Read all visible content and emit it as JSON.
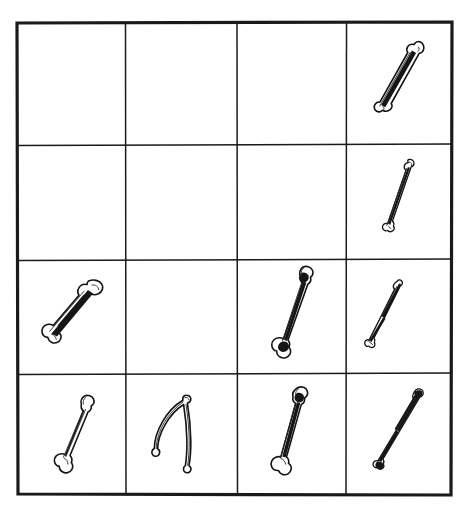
{
  "figure": {
    "background_color": "#ffffff",
    "ink_color": "#141414",
    "grid": {
      "rows": 4,
      "columns": 4,
      "border_color": "#1a1a1a",
      "border_width_px": 3,
      "inner_line_width_px": 1.5,
      "left_px": 16,
      "top_px": 22,
      "right_px": 452,
      "bottom_px": 495,
      "column_edges_px": [
        16,
        125,
        237,
        346,
        452
      ],
      "row_edges_px": [
        22,
        145,
        260,
        374,
        495
      ]
    },
    "cells": [
      {
        "row": 1,
        "column": 1,
        "content": "empty",
        "label": "cell-r1c1-empty"
      },
      {
        "row": 1,
        "column": 2,
        "content": "empty",
        "label": "cell-r1c2-empty"
      },
      {
        "row": 1,
        "column": 3,
        "content": "empty",
        "label": "cell-r1c3-empty"
      },
      {
        "row": 1,
        "column": 4,
        "content": "bone",
        "label": "cell-r1c4-bone",
        "bone": {
          "kind": "slender-long-bone",
          "orientation_degrees": 55,
          "shading": "dark-streak-mid-shaft",
          "ends": "flared-both-ends"
        }
      },
      {
        "row": 2,
        "column": 1,
        "content": "empty",
        "label": "cell-r2c1-empty"
      },
      {
        "row": 2,
        "column": 2,
        "content": "empty",
        "label": "cell-r2c2-empty"
      },
      {
        "row": 2,
        "column": 3,
        "content": "empty",
        "label": "cell-r2c3-empty"
      },
      {
        "row": 2,
        "column": 4,
        "content": "bone",
        "label": "cell-r2c4-bone",
        "bone": {
          "kind": "thin-straight-bone",
          "orientation_degrees": 70,
          "shading": "light-hatched-shaft",
          "ends": "small-knob-top-splayed-bottom"
        }
      },
      {
        "row": 3,
        "column": 1,
        "content": "bone",
        "label": "cell-r3c1-bone",
        "bone": {
          "kind": "thick-long-bone",
          "orientation_degrees": 50,
          "shading": "heavy-dark-shaft-stripe",
          "ends": "bulbous-both-ends"
        }
      },
      {
        "row": 3,
        "column": 2,
        "content": "empty",
        "label": "cell-r3c2-empty"
      },
      {
        "row": 3,
        "column": 3,
        "content": "bone",
        "label": "cell-r3c3-bone",
        "bone": {
          "kind": "long-bone-notched",
          "orientation_degrees": 72,
          "shading": "dark-wedges-at-both-ends",
          "ends": "notched-top-splayed-bottom"
        }
      },
      {
        "row": 3,
        "column": 4,
        "content": "bone",
        "label": "cell-r3c4-bone",
        "bone": {
          "kind": "very-thin-bone",
          "orientation_degrees": 60,
          "shading": "dark-thickening-upper-half",
          "ends": "pointed-both-ends"
        }
      },
      {
        "row": 4,
        "column": 1,
        "content": "bone",
        "label": "cell-r4c1-bone",
        "bone": {
          "kind": "pale-long-bone",
          "orientation_degrees": 72,
          "shading": "outline-only-faint-hairline",
          "ends": "knobbed-both-ends"
        }
      },
      {
        "row": 4,
        "column": 2,
        "content": "wishbone",
        "label": "cell-r4c2-wishbone",
        "bone": {
          "kind": "wishbone-furcula",
          "orientation_degrees": 0,
          "shading": "outline-only",
          "ends": "two-prongs-apex-top"
        }
      },
      {
        "row": 4,
        "column": 3,
        "content": "bone",
        "label": "cell-r4c3-bone",
        "bone": {
          "kind": "long-bone-notched",
          "orientation_degrees": 76,
          "shading": "dark-wedge-at-top",
          "ends": "notched-top-splayed-bottom"
        }
      },
      {
        "row": 4,
        "column": 4,
        "content": "bone",
        "label": "cell-r4c4-bone",
        "bone": {
          "kind": "thin-bone-dark",
          "orientation_degrees": 55,
          "shading": "solid-black-upper-shaft",
          "ends": "club-top-splayed-bottom"
        }
      }
    ]
  }
}
